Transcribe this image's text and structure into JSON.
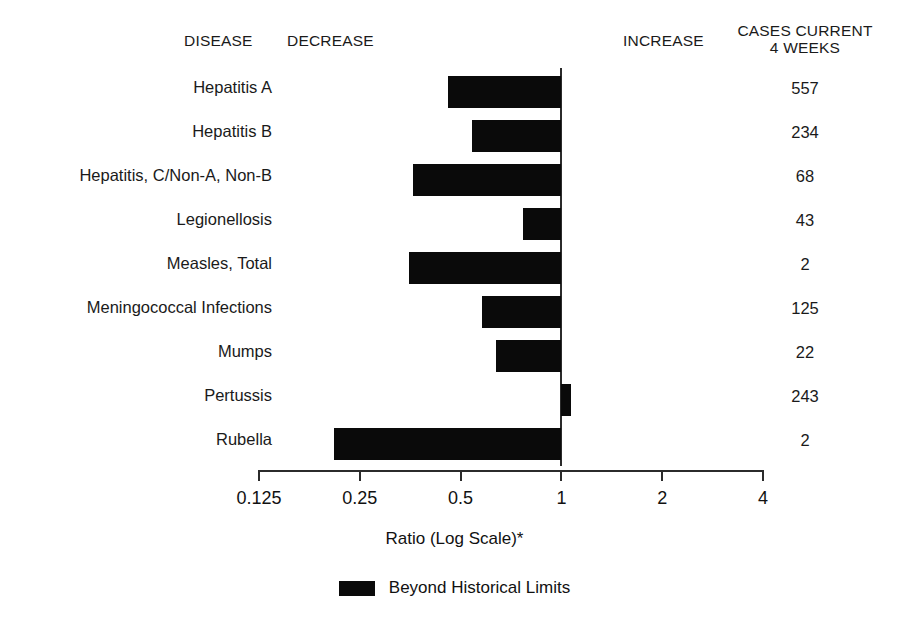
{
  "header": {
    "disease": "DISEASE",
    "decrease": "DECREASE",
    "increase": "INCREASE",
    "cases_line1": "CASES CURRENT",
    "cases_line2": "4 WEEKS"
  },
  "axis": {
    "title": "Ratio (Log Scale)*",
    "tick_labels": [
      "0.125",
      "0.25",
      "0.5",
      "1",
      "2",
      "4"
    ],
    "tick_values": [
      0.125,
      0.25,
      0.5,
      1,
      2,
      4
    ]
  },
  "legend": {
    "label": "Beyond Historical Limits",
    "swatch_color": "#0a0a0a"
  },
  "colors": {
    "bar": "#0a0a0a",
    "axis": "#2b2b2b",
    "text": "#111111",
    "background": "#ffffff"
  },
  "chart_data": {
    "type": "bar",
    "orientation": "horizontal",
    "title": "",
    "subtitle": "",
    "xlabel": "Ratio (Log Scale)*",
    "ylabel": "DISEASE",
    "xscale": "log",
    "xlim": [
      0.125,
      4
    ],
    "xticks": [
      0.125,
      0.25,
      0.5,
      1,
      2,
      4
    ],
    "xticklabels": [
      "0.125",
      "0.25",
      "0.5",
      "1",
      "2",
      "4"
    ],
    "grid": false,
    "baseline": 1,
    "legend": [
      "Beyond Historical Limits"
    ],
    "legend_position": "bottom-center",
    "categories": [
      "Hepatitis A",
      "Hepatitis B",
      "Hepatitis, C/Non-A, Non-B",
      "Legionellosis",
      "Measles, Total",
      "Meningococcal Infections",
      "Mumps",
      "Pertussis",
      "Rubella"
    ],
    "values": [
      0.46,
      0.54,
      0.36,
      0.77,
      0.35,
      0.58,
      0.64,
      1.07,
      0.21
    ],
    "extra_column": {
      "name": "CASES CURRENT 4 WEEKS",
      "values": [
        557,
        234,
        68,
        43,
        2,
        125,
        22,
        243,
        2
      ]
    },
    "rows": [
      {
        "disease": "Hepatitis A",
        "ratio": 0.46,
        "cases": "557"
      },
      {
        "disease": "Hepatitis B",
        "ratio": 0.54,
        "cases": "234"
      },
      {
        "disease": "Hepatitis, C/Non-A, Non-B",
        "ratio": 0.36,
        "cases": "68"
      },
      {
        "disease": "Legionellosis",
        "ratio": 0.77,
        "cases": "43"
      },
      {
        "disease": "Measles, Total",
        "ratio": 0.35,
        "cases": "2"
      },
      {
        "disease": "Meningococcal Infections",
        "ratio": 0.58,
        "cases": "125"
      },
      {
        "disease": "Mumps",
        "ratio": 0.64,
        "cases": "22"
      },
      {
        "disease": "Pertussis",
        "ratio": 1.07,
        "cases": "243"
      },
      {
        "disease": "Rubella",
        "ratio": 0.21,
        "cases": "2"
      }
    ]
  }
}
